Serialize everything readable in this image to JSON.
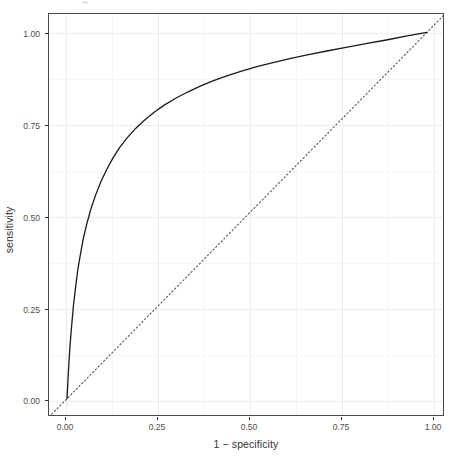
{
  "figure": {
    "background_color": "#ffffff",
    "panel_border_color": "#4a4a4a",
    "grid_major_color": "#ebebeb",
    "grid_minor_color": "#f5f5f5",
    "curve_color": "#1a1a1a",
    "reference_line_color": "#555555",
    "tick_text_color": "#4d4d4d",
    "axis_title_color": "#333333"
  },
  "chart_data": {
    "type": "line",
    "title": "",
    "subtitle": "",
    "xlabel": "1 − specificity",
    "ylabel": "sensitivity",
    "xlim": [
      -0.05,
      1.05
    ],
    "ylim": [
      -0.05,
      1.05
    ],
    "xticks": [
      0,
      0.25,
      0.5,
      0.75,
      1
    ],
    "yticks": [
      0,
      0.25,
      0.5,
      0.75,
      1
    ],
    "xticklabels": [
      "0.00",
      "0.25",
      "0.50",
      "0.75",
      "1.00"
    ],
    "yticklabels": [
      "0.00",
      "0.25",
      "0.50",
      "0.75",
      "1.00"
    ],
    "grid": true,
    "legend": false,
    "legend_position": "none",
    "annotations": [],
    "series": [
      {
        "name": "ROC curve",
        "style": "solid",
        "color": "#1a1a1a",
        "linewidth": 1.3,
        "x": [
          0.0,
          0.004,
          0.008,
          0.013,
          0.018,
          0.024,
          0.03,
          0.038,
          0.046,
          0.056,
          0.067,
          0.08,
          0.094,
          0.11,
          0.127,
          0.146,
          0.167,
          0.19,
          0.215,
          0.242,
          0.271,
          0.302,
          0.335,
          0.37,
          0.407,
          0.446,
          0.487,
          0.53,
          0.575,
          0.622,
          0.671,
          0.722,
          0.775,
          0.83,
          0.887,
          0.945,
          1.0
        ],
        "y": [
          0.0,
          0.075,
          0.14,
          0.2,
          0.255,
          0.305,
          0.352,
          0.398,
          0.44,
          0.481,
          0.52,
          0.557,
          0.592,
          0.625,
          0.656,
          0.685,
          0.712,
          0.737,
          0.76,
          0.782,
          0.802,
          0.82,
          0.837,
          0.853,
          0.868,
          0.882,
          0.895,
          0.907,
          0.918,
          0.929,
          0.939,
          0.949,
          0.959,
          0.969,
          0.979,
          0.99,
          1.0
        ]
      },
      {
        "name": "chance reference line",
        "style": "dotted",
        "color": "#555555",
        "linewidth": 1.1,
        "x": [
          -0.05,
          1.05
        ],
        "y": [
          -0.05,
          1.05
        ]
      }
    ]
  }
}
